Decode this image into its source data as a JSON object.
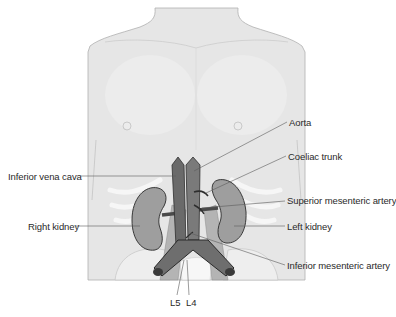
{
  "figure": {
    "colors": {
      "skin": "#e6e6e6",
      "skin_outline": "#a8a8a8",
      "vessel": "#6e6e6e",
      "vessel_dark": "#3a3a3a",
      "kidney": "#9a9a9a",
      "rib": "#f4f4f4",
      "leader_line": "#5a5a5a"
    },
    "labels": {
      "aorta": "Aorta",
      "coeliac_trunk": "Coeliac trunk",
      "inferior_vena_cava": "Inferior vena cava",
      "superior_mesenteric_artery": "Superior mesenteric artery",
      "right_kidney": "Right kidney",
      "left_kidney": "Left kidney",
      "inferior_mesenteric_artery": "Inferior mesenteric artery",
      "l5": "L5",
      "l4": "L4"
    }
  }
}
